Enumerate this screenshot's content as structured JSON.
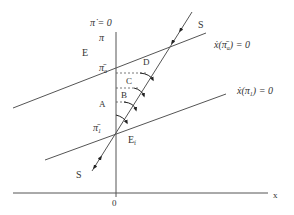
{
  "diagram": {
    "colors": {
      "line": "#555555",
      "text": "#333333",
      "background": "#ffffff"
    },
    "axes": {
      "x_label": "x",
      "origin_label": "0",
      "vertical_top_label": "π̇ = 0",
      "vertical_pi_label": "π"
    },
    "regions": {
      "E": "E",
      "A": "A",
      "B": "B",
      "C": "C",
      "D": "D"
    },
    "levels": {
      "pi_a": "π̄",
      "pi_a_sub": "a",
      "pi_1": "π̄",
      "pi_1_sub": "1"
    },
    "equilibrium": {
      "label": "E",
      "sub": "f"
    },
    "trajectory": {
      "label_top": "S",
      "label_bottom": "S"
    },
    "curves": {
      "upper": {
        "lhs": "ẋ(",
        "pi": "π̄",
        "sub": "a",
        "rhs": ") = 0"
      },
      "lower": {
        "lhs": "ẋ(",
        "pi": "π",
        "sub": "1",
        "rhs": ") = 0"
      }
    }
  }
}
